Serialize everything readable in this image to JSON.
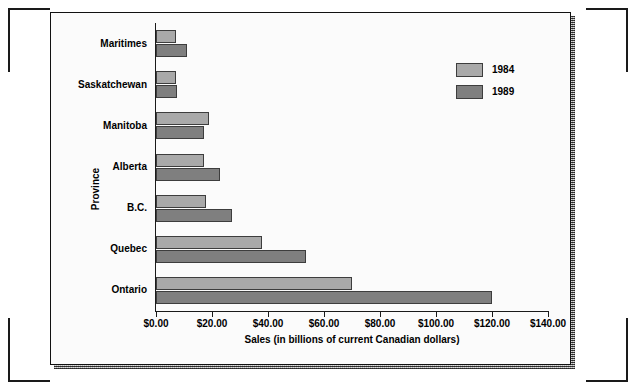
{
  "chart_data": {
    "type": "bar",
    "orientation": "horizontal",
    "title": "",
    "xlabel": "Sales (in billions of current Canadian dollars)",
    "ylabel": "Province",
    "categories": [
      "Maritimes",
      "Saskatchewan",
      "Manitoba",
      "Alberta",
      "B.C.",
      "Quebec",
      "Ontario"
    ],
    "series": [
      {
        "name": "1984",
        "color": "#a9a9a9",
        "values": [
          7.0,
          7.0,
          19.0,
          17.0,
          18.0,
          38.0,
          70.0
        ]
      },
      {
        "name": "1989",
        "color": "#7f7f7f",
        "values": [
          11.0,
          7.5,
          17.0,
          23.0,
          27.0,
          53.5,
          120.0
        ]
      }
    ],
    "xlim": [
      0,
      140
    ],
    "xtick_values": [
      0,
      20,
      40,
      60,
      80,
      100,
      120,
      140
    ],
    "xtick_labels": [
      "$0.00",
      "$20.00",
      "$40.00",
      "$60.00",
      "$80.00",
      "$100.00",
      "$120.00",
      "$140.00"
    ],
    "grid": false,
    "legend_position": "upper right",
    "legend_entries": [
      "1984",
      "1989"
    ]
  }
}
